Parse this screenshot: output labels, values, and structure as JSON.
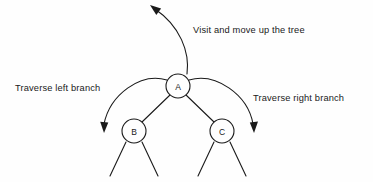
{
  "diagram": {
    "type": "tree-traversal-diagram",
    "background_color": "#fefefe",
    "stroke_color": "#1a1a1a",
    "nodes": [
      {
        "id": "A",
        "label": "A",
        "cx": 178,
        "cy": 86,
        "r": 12
      },
      {
        "id": "B",
        "label": "B",
        "cx": 134,
        "cy": 131,
        "r": 12
      },
      {
        "id": "C",
        "label": "C",
        "cx": 222,
        "cy": 131,
        "r": 12
      }
    ],
    "edges": [
      {
        "from": "A",
        "to": "B"
      },
      {
        "from": "A",
        "to": "C"
      },
      {
        "from": "B",
        "to": "b-left-child"
      },
      {
        "from": "B",
        "to": "b-right-child"
      },
      {
        "from": "C",
        "to": "c-left-child"
      },
      {
        "from": "C",
        "to": "c-right-child"
      }
    ],
    "annotations": [
      {
        "id": "visit-up",
        "text": "Visit and move up the tree",
        "direction": "up-left",
        "arrow_tip": [
          151,
          6
        ]
      },
      {
        "id": "left-branch",
        "text": "Traverse left branch",
        "direction": "down-left",
        "arrow_tip": [
          103,
          131
        ]
      },
      {
        "id": "right-branch",
        "text": "Traverse right branch",
        "direction": "down-right",
        "arrow_tip": [
          254,
          131
        ]
      }
    ]
  }
}
